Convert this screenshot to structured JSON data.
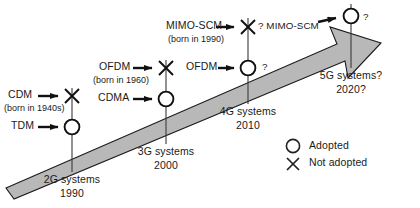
{
  "figure": {
    "arrow_color": "#b3b3b3",
    "arrow_stroke": "#1a1a1a",
    "text_color": "#1a1a1a"
  },
  "tech_labels": [
    {
      "id": "cdm",
      "name": "CDM",
      "born": "(born in 1940s)",
      "marker": "x",
      "marker_name": "not-adopted-marker"
    },
    {
      "id": "tdm",
      "name": "TDM",
      "born": "",
      "marker": "circle",
      "marker_name": "adopted-marker"
    },
    {
      "id": "ofdm-1960",
      "name": "OFDM",
      "born": "(born in 1960)",
      "marker": "x",
      "marker_name": "not-adopted-marker"
    },
    {
      "id": "cdma",
      "name": "CDMA",
      "born": "",
      "marker": "circle",
      "marker_name": "adopted-marker"
    },
    {
      "id": "mimo-scm",
      "name": "MIMO-SCM",
      "born": "(born in 1990)",
      "marker": "x",
      "marker_name": "unknown-marker"
    },
    {
      "id": "ofdm-4g",
      "name": "OFDM",
      "born": "",
      "marker": "circle",
      "marker_name": "unknown-marker"
    }
  ],
  "unknown_annotations": {
    "mimo_scm_4g": "? MIMO-SCM",
    "ofdm_4g": "?",
    "fiveg": "?"
  },
  "generations": [
    {
      "id": "2g",
      "name": "2G systems",
      "year": "1990"
    },
    {
      "id": "3g",
      "name": "3G systems",
      "year": "2000"
    },
    {
      "id": "4g",
      "name": "4G systems",
      "year": "2010"
    },
    {
      "id": "5g",
      "name": "5G systems?",
      "year": "2020?"
    }
  ],
  "legend": {
    "items": [
      {
        "id": "adopted",
        "glyph": "circle",
        "label": "Adopted"
      },
      {
        "id": "not-adopted",
        "glyph": "x",
        "label": "Not adopted"
      }
    ]
  }
}
